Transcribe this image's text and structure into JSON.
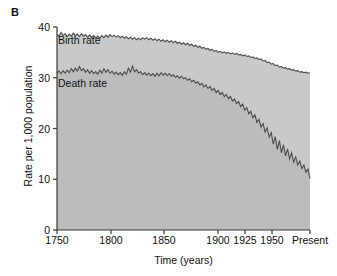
{
  "figure": {
    "panel_label": "B",
    "background_color": "#ffffff"
  },
  "chart_data": {
    "type": "area",
    "title": "",
    "xlabel": "Time (years)",
    "ylabel": "Rate per 1,000 population",
    "grid": false,
    "legend_position": "inline-annotations",
    "ylim": [
      0,
      40
    ],
    "yticks": [
      0,
      10,
      20,
      30,
      40
    ],
    "ytick_labels": [
      "0",
      "10",
      "20",
      "30",
      "40"
    ],
    "xtick_labels": [
      "1750",
      "1800",
      "1850",
      "1900",
      "1925",
      "1950",
      "Present"
    ],
    "xtick_values": [
      1750,
      1800,
      1850,
      1900,
      1925,
      1950,
      2000
    ],
    "xtick_positions_px": [
      57,
      111,
      164,
      218,
      245,
      272,
      310
    ],
    "x_axis_note": "non-uniform spacing: 1750-1900 linear, then compressed 1900/1925/1950/Present",
    "annotations": [
      {
        "text": "Birth rate",
        "x_px": 58,
        "y_px": 44
      },
      {
        "text": "Death rate",
        "x_px": 58,
        "y_px": 87
      }
    ],
    "colors": {
      "line": "#4a4a4a",
      "band_birth_to_death": "#c9c9c9",
      "band_below_death": "#bcbcbc",
      "above_birth": "#ffffff",
      "axis": "#3a3a3a",
      "text": "#111111"
    },
    "series": [
      {
        "name": "Birth rate",
        "values": [
          38.6,
          38.2,
          38.9,
          38.3,
          38.7,
          38.1,
          38.6,
          38.2,
          38.8,
          38.3,
          38.6,
          38.1,
          38.7,
          38.2,
          38.5,
          38.0,
          38.4,
          37.9,
          38.3,
          37.8,
          38.2,
          37.8,
          38.3,
          37.9,
          38.4,
          38.0,
          38.5,
          38.1,
          38.4,
          38.0,
          38.3,
          37.9,
          38.2,
          37.8,
          38.1,
          37.7,
          38.0,
          37.6,
          37.9,
          37.5,
          37.8,
          37.5,
          37.9,
          37.6,
          37.9,
          37.5,
          37.8,
          37.4,
          37.7,
          37.3,
          37.6,
          37.2,
          37.5,
          37.1,
          37.4,
          37.0,
          37.3,
          36.9,
          37.2,
          36.8,
          37.0,
          36.6,
          36.9,
          36.5,
          36.8,
          36.4,
          36.6,
          36.2,
          36.4,
          36.0,
          36.2,
          35.8,
          36.0,
          35.6,
          35.8,
          35.4,
          35.6,
          35.2,
          35.4,
          35.0,
          35.2,
          34.9,
          35.1,
          34.8,
          35.0,
          34.7,
          34.9,
          34.6,
          34.8,
          34.5,
          34.6,
          34.3,
          34.5,
          34.2,
          34.3,
          34.0,
          34.1,
          33.8,
          33.9,
          33.6,
          33.7,
          33.3,
          33.4,
          33.0,
          33.1,
          32.7,
          32.8,
          32.4,
          32.5,
          32.1,
          32.2,
          31.9,
          32.0,
          31.7,
          31.8,
          31.5,
          31.6,
          31.3,
          31.4,
          31.1,
          31.2,
          31.0,
          31.1,
          30.9,
          31.0
        ]
      },
      {
        "name": "Death rate",
        "values": [
          30.9,
          31.3,
          30.8,
          31.4,
          30.9,
          31.5,
          31.0,
          31.8,
          31.2,
          31.9,
          31.3,
          32.2,
          31.4,
          31.8,
          31.1,
          31.6,
          30.9,
          31.4,
          30.8,
          31.2,
          30.7,
          31.5,
          30.9,
          31.8,
          31.1,
          31.6,
          30.9,
          31.3,
          30.7,
          31.1,
          30.6,
          31.0,
          30.5,
          31.2,
          30.7,
          31.9,
          31.1,
          32.3,
          31.2,
          31.6,
          30.9,
          31.2,
          30.6,
          31.0,
          30.5,
          30.9,
          30.4,
          30.8,
          30.3,
          30.9,
          30.4,
          31.0,
          30.5,
          30.9,
          30.4,
          30.8,
          30.3,
          30.6,
          30.1,
          30.4,
          29.9,
          30.3,
          29.8,
          30.0,
          29.5,
          29.8,
          29.2,
          29.5,
          28.9,
          29.2,
          28.6,
          28.9,
          28.2,
          28.6,
          27.9,
          28.3,
          27.5,
          27.9,
          27.1,
          27.5,
          26.7,
          27.1,
          26.3,
          26.7,
          25.9,
          26.3,
          25.4,
          25.8,
          24.9,
          25.3,
          24.3,
          24.8,
          23.6,
          24.1,
          22.9,
          23.4,
          22.1,
          22.7,
          21.2,
          21.8,
          20.3,
          21.0,
          19.3,
          20.1,
          18.3,
          19.2,
          16.9,
          18.4,
          15.9,
          17.6,
          15.2,
          16.8,
          14.6,
          16.0,
          14.0,
          15.2,
          13.4,
          14.4,
          12.8,
          13.6,
          12.1,
          12.8,
          11.4,
          12.0,
          10.1
        ]
      }
    ]
  }
}
